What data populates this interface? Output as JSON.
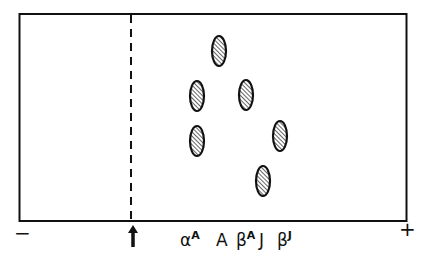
{
  "diagram": {
    "type": "electrophoresis-gel",
    "origin_marker": "arrow",
    "polarity": {
      "negative": "−",
      "positive": "+"
    },
    "colors": {
      "line": "#111111",
      "background": "#ffffff",
      "spot_fill": "#888888"
    },
    "lanes": [
      {
        "base": "α",
        "sup": "A"
      },
      {
        "base": "A",
        "sup": ""
      },
      {
        "base": "β",
        "sup": "A"
      },
      {
        "base": "J",
        "sup": ""
      },
      {
        "base": "β",
        "sup": "J"
      }
    ],
    "spots": [
      {
        "cx": 219,
        "cy": 51
      },
      {
        "cx": 197,
        "cy": 96
      },
      {
        "cx": 246,
        "cy": 95
      },
      {
        "cx": 197,
        "cy": 141
      },
      {
        "cx": 280,
        "cy": 136
      },
      {
        "cx": 263,
        "cy": 181
      }
    ]
  }
}
